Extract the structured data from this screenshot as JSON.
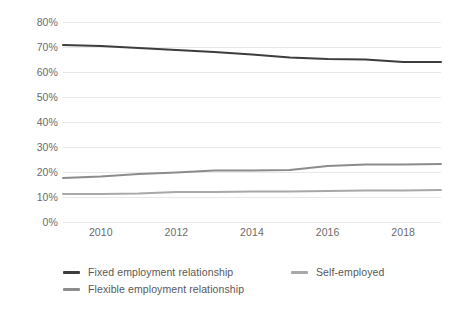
{
  "chart_data": {
    "type": "line",
    "title": "",
    "subtitle": "",
    "xlabel": "",
    "ylabel": "",
    "x": [
      2009,
      2010,
      2011,
      2012,
      2013,
      2014,
      2015,
      2016,
      2017,
      2018,
      2019
    ],
    "xlim": [
      2009,
      2019
    ],
    "ylim": [
      0,
      80
    ],
    "ytick_values": [
      0,
      10,
      20,
      30,
      40,
      50,
      60,
      70,
      80
    ],
    "ytick_labels": [
      "0%",
      "10%",
      "20%",
      "30%",
      "40%",
      "50%",
      "60%",
      "70%",
      "80%"
    ],
    "xtick_values": [
      2010,
      2012,
      2014,
      2016,
      2018
    ],
    "xtick_labels": [
      "2010",
      "2012",
      "2014",
      "2016",
      "2018"
    ],
    "grid": "horizontal",
    "legend_position": "bottom-left",
    "series": [
      {
        "name": "Fixed employment relationship",
        "color": "#3d3d3d",
        "values": [
          70.8,
          70.4,
          69.6,
          68.8,
          68.0,
          67.0,
          65.8,
          65.2,
          65.0,
          64.0,
          64.0
        ]
      },
      {
        "name": "Flexible employment relationship",
        "color": "#8c8c8c",
        "values": [
          17.6,
          18.2,
          19.2,
          19.8,
          20.6,
          20.6,
          20.8,
          22.4,
          23.0,
          23.0,
          23.2
        ]
      },
      {
        "name": "Self-employed",
        "color": "#a8a8a8",
        "values": [
          11.2,
          11.2,
          11.4,
          12.0,
          12.0,
          12.2,
          12.2,
          12.4,
          12.6,
          12.6,
          12.8
        ]
      }
    ]
  },
  "legend": {
    "entries": [
      {
        "label": "Fixed employment relationship",
        "color": "#3d3d3d"
      },
      {
        "label": "Self-employed",
        "color": "#a8a8a8"
      },
      {
        "label": "Flexible employment relationship",
        "color": "#8c8c8c"
      }
    ]
  },
  "colors": {
    "gridline": "#e8e8e8",
    "axis_text": "#6b6b6b",
    "background": "#ffffff"
  }
}
